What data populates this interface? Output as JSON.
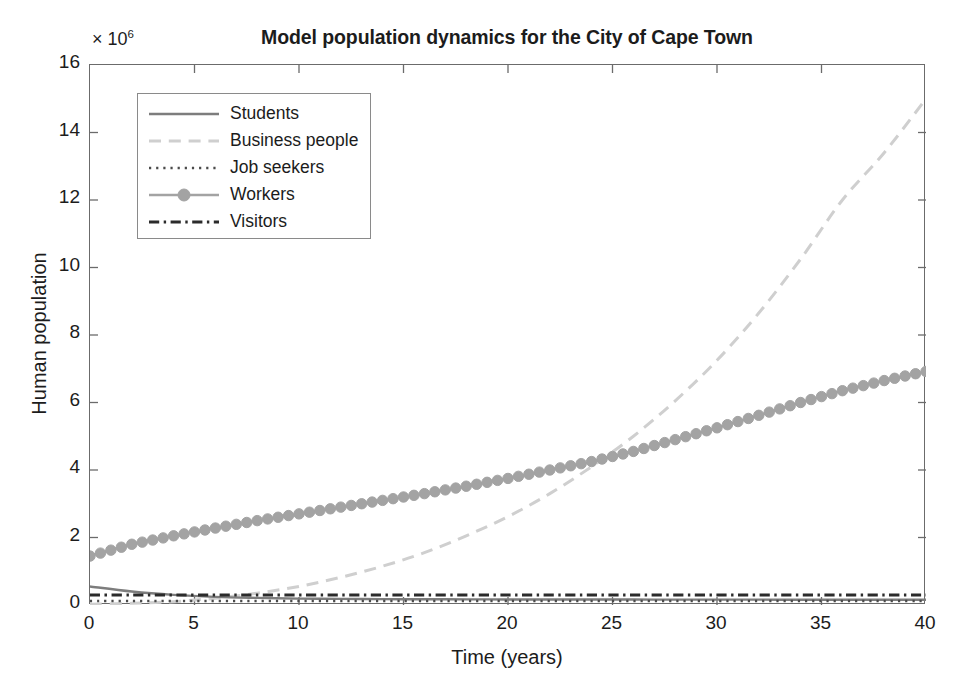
{
  "figure": {
    "title": "Model population dynamics for the City of Cape Town",
    "background": "#ffffff",
    "axis_color": "#6b6b6b"
  },
  "axes": {
    "y_exponent_prefix": "× 10",
    "y_exponent_power": "6",
    "y_label": "Human population",
    "x_label": "Time (years)"
  },
  "chart_data": {
    "type": "line",
    "title": "Model population dynamics for the City of Cape Town",
    "xlabel": "Time (years)",
    "ylabel": "Human population",
    "y_multiplier": 1000000,
    "y_multiplier_text": "× 10^6",
    "xlim": [
      0,
      40
    ],
    "ylim": [
      0,
      16
    ],
    "xticks": [
      0,
      5,
      10,
      15,
      20,
      25,
      30,
      35,
      40
    ],
    "yticks": [
      0,
      2,
      4,
      6,
      8,
      10,
      12,
      14,
      16
    ],
    "grid": false,
    "legend_position": "upper left",
    "x": [
      0,
      2,
      4,
      6,
      8,
      10,
      12,
      14,
      16,
      18,
      20,
      22,
      24,
      26,
      28,
      30,
      32,
      34,
      36,
      38,
      40
    ],
    "series": [
      {
        "name": "Students",
        "color": "#7d7d7d",
        "linestyle": "solid",
        "marker": "none",
        "linewidth": 2.4,
        "values": [
          0.55,
          0.4,
          0.3,
          0.24,
          0.21,
          0.19,
          0.18,
          0.175,
          0.17,
          0.168,
          0.165,
          0.163,
          0.162,
          0.161,
          0.16,
          0.159,
          0.158,
          0.157,
          0.156,
          0.155,
          0.155
        ]
      },
      {
        "name": "Business people",
        "color": "#cfcfcf",
        "linestyle": "dashed",
        "marker": "none",
        "linewidth": 3.0,
        "values": [
          0.02,
          0.05,
          0.1,
          0.2,
          0.35,
          0.55,
          0.82,
          1.15,
          1.55,
          2.05,
          2.62,
          3.3,
          4.1,
          5.0,
          6.05,
          7.25,
          8.65,
          10.25,
          12.0,
          13.4,
          15.0
        ]
      },
      {
        "name": "Job seekers",
        "color": "#4a4a4a",
        "linestyle": "dotted",
        "marker": "none",
        "linewidth": 2.6,
        "values": [
          0.12,
          0.12,
          0.12,
          0.12,
          0.12,
          0.12,
          0.12,
          0.12,
          0.12,
          0.12,
          0.12,
          0.12,
          0.12,
          0.12,
          0.12,
          0.12,
          0.12,
          0.12,
          0.12,
          0.12,
          0.12
        ]
      },
      {
        "name": "Workers",
        "color": "#a3a3a3",
        "linestyle": "solid",
        "marker": "circle",
        "linewidth": 2.4,
        "values": [
          1.45,
          1.8,
          2.05,
          2.28,
          2.5,
          2.7,
          2.9,
          3.1,
          3.3,
          3.52,
          3.75,
          4.0,
          4.25,
          4.55,
          4.9,
          5.25,
          5.62,
          6.0,
          6.35,
          6.65,
          6.92
        ]
      },
      {
        "name": "Visitors",
        "color": "#2b2b2b",
        "linestyle": "dashdot",
        "marker": "none",
        "linewidth": 3.0,
        "values": [
          0.3,
          0.3,
          0.3,
          0.3,
          0.3,
          0.3,
          0.3,
          0.3,
          0.3,
          0.3,
          0.3,
          0.3,
          0.3,
          0.3,
          0.3,
          0.3,
          0.3,
          0.3,
          0.3,
          0.3,
          0.3
        ]
      }
    ]
  }
}
